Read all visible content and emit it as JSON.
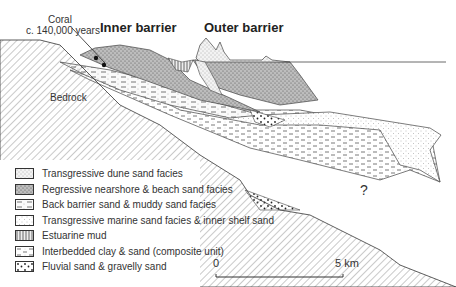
{
  "labels": {
    "inner_barrier": "Inner barrier",
    "outer_barrier": "Outer barrier",
    "coral_line1": "Coral",
    "coral_line2": "c. 140,000 years",
    "bedrock": "Bedrock",
    "unknown": "?"
  },
  "legend": [
    {
      "pattern": "transgressive-dune",
      "label": "Transgressive dune sand facies"
    },
    {
      "pattern": "regressive-nearshore",
      "label": "Regressive nearshore & beach sand facies"
    },
    {
      "pattern": "back-barrier",
      "label": "Back barrier sand & muddy sand facies"
    },
    {
      "pattern": "transgressive-marine",
      "label": "Transgressive marine sand facies & inner shelf sand"
    },
    {
      "pattern": "estuarine-mud",
      "label": "Estuarine mud"
    },
    {
      "pattern": "interbedded",
      "label": "Interbedded clay & sand (composite unit)"
    },
    {
      "pattern": "fluvial",
      "label": "Fluvial sand & gravelly sand"
    }
  ],
  "scale": {
    "start": "0",
    "end": "5 km"
  }
}
